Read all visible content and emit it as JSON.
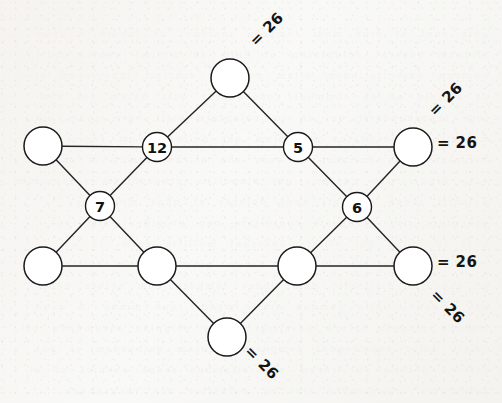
{
  "figure": {
    "kind": "magic-hexagram-diagram",
    "background_color": "#f8f8f6",
    "ink_color": "#1a1a1a",
    "node_fill": "#ffffff",
    "magic_constant": "26"
  },
  "nodes": [
    {
      "id": "top",
      "label": "",
      "filled": false,
      "cx": 230,
      "cy": 78,
      "r": 19,
      "stroke_width": 1.5
    },
    {
      "id": "left-upper",
      "label": "",
      "filled": false,
      "cx": 43,
      "cy": 146,
      "r": 19,
      "stroke_width": 1.5
    },
    {
      "id": "inner-upper-left",
      "label": "12",
      "filled": true,
      "cx": 157,
      "cy": 147,
      "r": 14.5,
      "stroke_width": 1.4
    },
    {
      "id": "inner-upper-right",
      "label": "5",
      "filled": true,
      "cx": 298,
      "cy": 147,
      "r": 14.5,
      "stroke_width": 1.4
    },
    {
      "id": "right-upper",
      "label": "",
      "filled": false,
      "cx": 413,
      "cy": 147,
      "r": 19,
      "stroke_width": 1.5
    },
    {
      "id": "inner-left",
      "label": "7",
      "filled": true,
      "cx": 100,
      "cy": 206,
      "r": 14.5,
      "stroke_width": 1.4
    },
    {
      "id": "inner-right",
      "label": "6",
      "filled": true,
      "cx": 357,
      "cy": 207,
      "r": 14.5,
      "stroke_width": 1.4
    },
    {
      "id": "left-lower",
      "label": "",
      "filled": false,
      "cx": 43,
      "cy": 266,
      "r": 19,
      "stroke_width": 1.5
    },
    {
      "id": "inner-lower-left",
      "label": "",
      "filled": false,
      "cx": 157,
      "cy": 266,
      "r": 19,
      "stroke_width": 1.5
    },
    {
      "id": "inner-lower-right",
      "label": "",
      "filled": false,
      "cx": 297,
      "cy": 266,
      "r": 19,
      "stroke_width": 1.5
    },
    {
      "id": "right-lower",
      "label": "",
      "filled": false,
      "cx": 413,
      "cy": 266,
      "r": 19,
      "stroke_width": 1.5
    },
    {
      "id": "bottom",
      "label": "",
      "filled": false,
      "cx": 227,
      "cy": 337,
      "r": 19,
      "stroke_width": 1.5
    }
  ],
  "edges": [
    {
      "from": "top",
      "to": "inner-upper-left"
    },
    {
      "from": "top",
      "to": "inner-upper-right"
    },
    {
      "from": "left-upper",
      "to": "inner-upper-left"
    },
    {
      "from": "inner-upper-left",
      "to": "inner-upper-right"
    },
    {
      "from": "inner-upper-right",
      "to": "right-upper"
    },
    {
      "from": "left-upper",
      "to": "inner-left"
    },
    {
      "from": "inner-upper-left",
      "to": "inner-left"
    },
    {
      "from": "inner-upper-right",
      "to": "inner-right"
    },
    {
      "from": "right-upper",
      "to": "inner-right"
    },
    {
      "from": "inner-left",
      "to": "left-lower"
    },
    {
      "from": "inner-left",
      "to": "inner-lower-left"
    },
    {
      "from": "inner-right",
      "to": "inner-lower-right"
    },
    {
      "from": "inner-right",
      "to": "right-lower"
    },
    {
      "from": "left-lower",
      "to": "inner-lower-left"
    },
    {
      "from": "inner-lower-left",
      "to": "inner-lower-right"
    },
    {
      "from": "inner-lower-right",
      "to": "right-lower"
    },
    {
      "from": "inner-lower-left",
      "to": "bottom"
    },
    {
      "from": "inner-lower-right",
      "to": "bottom"
    }
  ],
  "sum_labels": [
    {
      "id": "sum-top",
      "text": "= 26",
      "x": 256,
      "y": 47,
      "rotation": -45
    },
    {
      "id": "sum-upper-right-diagonal",
      "text": "= 26",
      "x": 435,
      "y": 117,
      "rotation": -45
    },
    {
      "id": "sum-upper-right-horizontal",
      "text": "= 26",
      "x": 437,
      "y": 148,
      "rotation": 0
    },
    {
      "id": "sum-lower-right-horizontal",
      "text": "= 26",
      "x": 437,
      "y": 267,
      "rotation": 0
    },
    {
      "id": "sum-lower-right-diagonal",
      "text": "= 26",
      "x": 430,
      "y": 296,
      "rotation": 45
    },
    {
      "id": "sum-bottom",
      "text": "= 26",
      "x": 244,
      "y": 352,
      "rotation": 45
    }
  ],
  "bleed_through_text": "quia sunt et eius modi tempora incidunt ut labore magnam aliquam quaerat voluptatem ut enim ad minima veniam quis nostrum exercitationem ullam corporis suscipit laboriosam nisi ut aliquid ex ea commodi consequatur quis autem vel eum iure reprehenderit qui in ea voluptate velit esse quam nihil molestiae consequatur vel illum qui dolorem eum fugiat quo voluptas nulla pariatur at vero eos et accusamus et iusto odio dignissimos ducimus qui blanditiis praesentium voluptatum deleniti atque corrupti quos dolores et quas molestias excepturi sint occaecati cupiditate non provident similique sunt in culpa qui officia deserunt mollitia animi id est laborum et dolorum fuga et harum quidem rerum facilis est et expedita distinctio nam libero tempore cum soluta nobis est eligendi optio cumque nihil impedit quo minus id quod maxime placeat facere possimus omnis voluptas assumenda est omnis dolor repellendus temporibus autem quibusdam et aut officiis debitis aut rerum necessitatibus saepe eveniet ut et voluptates repudiandae sint et molestiae non recusandae itaque earum rerum hic tenetur a sapiente delectus ut aut reiciendis voluptatibus maiores alias consequatur aut perferendis doloribus asperiores repellat"
}
